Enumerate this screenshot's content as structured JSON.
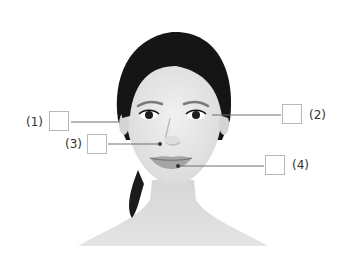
{
  "figure": {
    "markers": [
      {
        "id": "1",
        "label": "(1)",
        "target": "hairline near left temple / side of face"
      },
      {
        "id": "2",
        "label": "(2)",
        "target": "outer corner of right eye"
      },
      {
        "id": "3",
        "label": "(3)",
        "target": "left side of nose / cheek"
      },
      {
        "id": "4",
        "label": "(4)",
        "target": "lower lip / mouth"
      }
    ]
  },
  "colors": {
    "background": "#ffffff",
    "leader_line": "#6f6f6f",
    "box_border": "#b8b8b8",
    "hair": "#151515",
    "skin": "#e9e9e9",
    "lips": "#9a9a9a"
  }
}
